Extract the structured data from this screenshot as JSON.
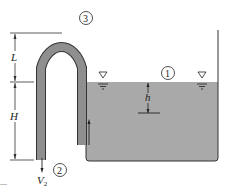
{
  "diagram": {
    "colors": {
      "water": "#a9a9a9",
      "tube": "#8f8f8f",
      "line": "#222222",
      "background": "#ffffff"
    },
    "points": [
      {
        "id": "1",
        "label": "1",
        "description": "free surface of tank"
      },
      {
        "id": "2",
        "label": "2",
        "description": "siphon exit"
      },
      {
        "id": "3",
        "label": "3",
        "description": "top of siphon"
      }
    ],
    "dimensions": {
      "L": "L",
      "H": "H",
      "h": "h"
    },
    "velocity_label": "V",
    "velocity_subscript": "2",
    "free_surface_symbol": "▽",
    "corner_text": "—"
  }
}
